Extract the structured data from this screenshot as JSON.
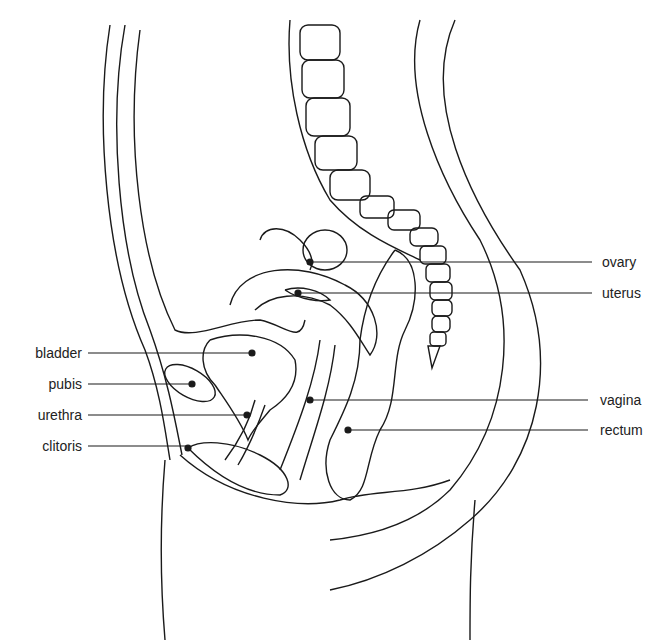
{
  "diagram": {
    "type": "anatomical sagittal section",
    "labels_left": [
      {
        "id": "bladder",
        "text": "bladder",
        "y": 353
      },
      {
        "id": "pubis",
        "text": "pubis",
        "y": 384
      },
      {
        "id": "urethra",
        "text": "urethra",
        "y": 415
      },
      {
        "id": "clitoris",
        "text": "clitoris",
        "y": 446
      }
    ],
    "labels_right": [
      {
        "id": "ovary",
        "text": "ovary",
        "y": 262
      },
      {
        "id": "uterus",
        "text": "uterus",
        "y": 293
      },
      {
        "id": "vagina",
        "text": "vagina",
        "y": 400
      },
      {
        "id": "rectum",
        "text": "rectum",
        "y": 430
      }
    ],
    "line_color": "#1a1a1a"
  }
}
